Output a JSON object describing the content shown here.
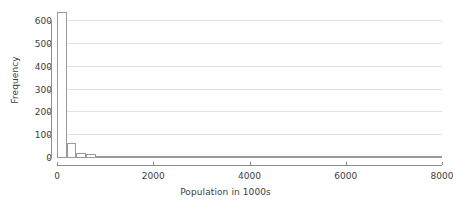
{
  "chart_data": {
    "type": "bar",
    "title": "",
    "subtitle": "",
    "xlabel": "Population in 1000s",
    "ylabel": "Frequency",
    "xlim": [
      0,
      8000
    ],
    "ylim": [
      0,
      650
    ],
    "xticks": [
      0,
      2000,
      4000,
      6000,
      8000
    ],
    "xtick_labels": [
      "0",
      "2000",
      "4000",
      "6000",
      "8000"
    ],
    "yticks": [
      0,
      100,
      200,
      300,
      400,
      500,
      600
    ],
    "ytick_labels": [
      "0",
      "100",
      "200",
      "300",
      "400",
      "500",
      "600"
    ],
    "grid": "horizontal",
    "legend": "none",
    "bin_width": 200,
    "bin_edges": [
      0,
      200,
      400,
      600,
      800,
      1000,
      1200,
      1400,
      1600,
      1800,
      2000,
      2200,
      2400,
      2600,
      2800,
      3000,
      3200,
      3400,
      3600,
      3800,
      4000,
      4200,
      4400,
      4600,
      4800,
      5000,
      5200,
      5400,
      5600,
      5800,
      6000,
      6200,
      6400,
      6600,
      6800,
      7000,
      7200,
      7400,
      7600,
      7800,
      8000
    ],
    "categories": [
      "0-200",
      "200-400",
      "400-600",
      "600-800",
      "800-1000",
      "1000-1200",
      "1200-1400",
      "1400-1600",
      "1600-1800",
      "1800-2000",
      "2000-2200",
      "2200-2400",
      "2400-2600",
      "2600-2800",
      "2800-3000",
      "3000-3200",
      "3200-3400",
      "3400-3600",
      "3600-3800",
      "3800-4000",
      "4000-4200",
      "4200-4400",
      "4400-4600",
      "4600-4800",
      "4800-5000",
      "5000-5200",
      "5200-5400",
      "5400-5600",
      "5600-5800",
      "5800-6000",
      "6000-6200",
      "6200-6400",
      "6400-6600",
      "6600-6800",
      "6800-7000",
      "7000-7200",
      "7200-7400",
      "7400-7600",
      "7600-7800",
      "7800-8000"
    ],
    "values": [
      640,
      66,
      20,
      16,
      7,
      5,
      4,
      3,
      2,
      2,
      2,
      1,
      1,
      2,
      1,
      1,
      1,
      1,
      1,
      1,
      1,
      0,
      0,
      1,
      0,
      0,
      1,
      1,
      0,
      0,
      0,
      0,
      0,
      0,
      0,
      0,
      0,
      0,
      0,
      1
    ]
  },
  "style": {
    "bar_fill": "#ffffff",
    "bar_stroke": "#9a9a9a",
    "grid_color": "#e2e2e2",
    "axis_color": "#8c8c8c",
    "text_color": "#3d3d3d",
    "background": "#ffffff"
  }
}
